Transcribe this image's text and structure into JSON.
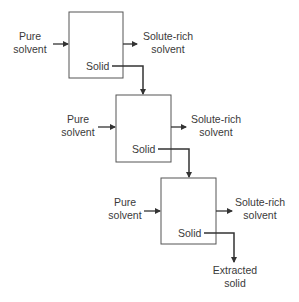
{
  "diagram": {
    "stages": [
      {
        "inlet_line1": "Pure",
        "inlet_line2": "solvent",
        "outlet_line1": "Solute-rich",
        "outlet_line2": "solvent",
        "solid_label": "Solid"
      },
      {
        "inlet_line1": "Pure",
        "inlet_line2": "solvent",
        "outlet_line1": "Solute-rich",
        "outlet_line2": "solvent",
        "solid_label": "Solid"
      },
      {
        "inlet_line1": "Pure",
        "inlet_line2": "solvent",
        "outlet_line1": "Solute-rich",
        "outlet_line2": "solvent",
        "solid_label": "Solid"
      }
    ],
    "final_output_line1": "Extracted",
    "final_output_line2": "solid",
    "colors": {
      "line": "#333333",
      "text": "#3a3a3a",
      "box_border": "#555555"
    }
  }
}
